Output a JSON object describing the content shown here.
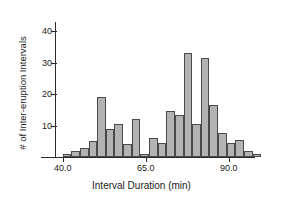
{
  "chart_data": {
    "type": "bar",
    "title": "",
    "subtitle": "",
    "xlabel": "Interval Duration (min)",
    "ylabel": "# of Inter-eruption Intervals",
    "xlim": [
      38.0,
      97.0
    ],
    "ylim": [
      0,
      43
    ],
    "grid": false,
    "legend": null,
    "bin_width": 2.6,
    "x_ticks": [
      40.0,
      65.0,
      90.0
    ],
    "x_tick_labels": [
      "40.0",
      "65.0",
      "90.0"
    ],
    "y_ticks": [
      10,
      20,
      30,
      40
    ],
    "y_tick_labels": [
      "10",
      "20",
      "30",
      "40"
    ],
    "bar_color": "#b3b3b3",
    "bar_edge_color": "#4a4a4a",
    "axis_color": "#2b2b2b",
    "bin_starts": [
      40.0,
      42.6,
      45.2,
      47.8,
      50.4,
      53.0,
      55.6,
      58.2,
      60.8,
      63.4,
      66.0,
      68.6,
      71.2,
      73.8,
      76.4,
      79.0,
      81.6,
      84.2,
      86.8,
      89.4,
      92.0
    ],
    "categories": [
      "40.0",
      "42.6",
      "45.2",
      "47.8",
      "50.4",
      "53.0",
      "55.6",
      "58.2",
      "60.8",
      "63.4",
      "66.0",
      "68.6",
      "71.2",
      "73.8",
      "76.4",
      "79.0",
      "81.6",
      "84.2",
      "86.8",
      "89.4",
      "92.0"
    ],
    "values": [
      1,
      2,
      3,
      5,
      19,
      9,
      10.5,
      4,
      12,
      1,
      6,
      4.5,
      14.5,
      13.5,
      33,
      10.5,
      31.5,
      16.5,
      7.5,
      4.5,
      5.5
    ],
    "bars": [
      {
        "x_start": 40.0,
        "x_end": 42.6,
        "count": 1
      },
      {
        "x_start": 42.6,
        "x_end": 45.2,
        "count": 2
      },
      {
        "x_start": 45.2,
        "x_end": 47.8,
        "count": 3
      },
      {
        "x_start": 47.8,
        "x_end": 50.4,
        "count": 5
      },
      {
        "x_start": 50.4,
        "x_end": 53.0,
        "count": 19
      },
      {
        "x_start": 53.0,
        "x_end": 55.6,
        "count": 9
      },
      {
        "x_start": 55.6,
        "x_end": 58.2,
        "count": 10.5
      },
      {
        "x_start": 58.2,
        "x_end": 60.8,
        "count": 4
      },
      {
        "x_start": 60.8,
        "x_end": 63.4,
        "count": 12
      },
      {
        "x_start": 63.4,
        "x_end": 66.0,
        "count": 1
      },
      {
        "x_start": 66.0,
        "x_end": 68.6,
        "count": 6
      },
      {
        "x_start": 68.6,
        "x_end": 71.2,
        "count": 4.5
      },
      {
        "x_start": 71.2,
        "x_end": 73.8,
        "count": 14.5
      },
      {
        "x_start": 73.8,
        "x_end": 76.4,
        "count": 13.5
      },
      {
        "x_start": 76.4,
        "x_end": 79.0,
        "count": 33
      },
      {
        "x_start": 79.0,
        "x_end": 81.6,
        "count": 10.5
      },
      {
        "x_start": 81.6,
        "x_end": 84.2,
        "count": 31.5
      },
      {
        "x_start": 84.2,
        "x_end": 86.8,
        "count": 16.5
      },
      {
        "x_start": 86.8,
        "x_end": 89.4,
        "count": 7.5
      },
      {
        "x_start": 89.4,
        "x_end": 92.0,
        "count": 4.5
      },
      {
        "x_start": 92.0,
        "x_end": 94.6,
        "count": 5.5
      },
      {
        "x_start": 94.6,
        "x_end": 97.2,
        "count": 2
      },
      {
        "x_start": 97.2,
        "x_end": 99.8,
        "count": 1
      }
    ]
  }
}
